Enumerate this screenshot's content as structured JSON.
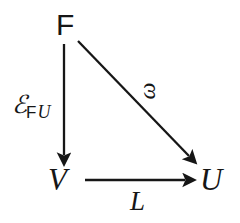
{
  "diagram": {
    "type": "commutative-diagram",
    "background_color": "#ffffff",
    "stroke_color": "#161616",
    "nodes": [
      {
        "id": "F",
        "label": "F",
        "x": 65,
        "y": 25,
        "style": "sans-serif upright"
      },
      {
        "id": "V",
        "label": "V",
        "x": 58,
        "y": 180,
        "style": "serif italic"
      },
      {
        "id": "U",
        "label": "U",
        "x": 210,
        "y": 180,
        "style": "serif italic"
      }
    ],
    "edges": [
      {
        "id": "F-to-V",
        "from": "F",
        "to": "V",
        "label": "E_FU",
        "label_parts": {
          "base": "ℰ",
          "subscript_roman": "F",
          "subscript_italic": "U"
        },
        "label_position": "left",
        "x1": 64,
        "y1": 44,
        "x2": 64,
        "y2": 163
      },
      {
        "id": "F-to-U",
        "from": "F",
        "to": "U",
        "label": "ω",
        "label_position": "above-right",
        "label_rotation_deg": -90,
        "x1": 78,
        "y1": 41,
        "x2": 196,
        "y2": 163
      },
      {
        "id": "V-to-U",
        "from": "V",
        "to": "U",
        "label": "L",
        "label_position": "below",
        "x1": 85,
        "y1": 180,
        "x2": 192,
        "y2": 180
      }
    ]
  },
  "labels": {
    "node_F": "F",
    "node_V": "V",
    "node_U": "U",
    "edge_vertical_base": "ℰ",
    "edge_vertical_sub_F": "F",
    "edge_vertical_sub_U": "U",
    "edge_diagonal": "ω",
    "edge_horizontal": "L"
  }
}
